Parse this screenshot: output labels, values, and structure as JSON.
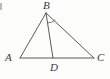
{
  "figure": {
    "kind": "geometry-diagram",
    "background_color": "#fdfdfc",
    "stroke_color": "#5a5a5a",
    "label_color": "#3b3b3b",
    "labels": {
      "a": "A",
      "b": "B",
      "c": "C",
      "d": "D"
    },
    "vertices": [
      {
        "name": "A",
        "x": 20,
        "y": 58
      },
      {
        "name": "B",
        "x": 46,
        "y": 13
      },
      {
        "name": "C",
        "x": 94,
        "y": 58
      },
      {
        "name": "D",
        "x": 53,
        "y": 58
      }
    ],
    "segments": [
      {
        "name": "AB",
        "from": "A",
        "to": "B"
      },
      {
        "name": "BC",
        "from": "B",
        "to": "C"
      },
      {
        "name": "AC",
        "from": "A",
        "to": "C"
      },
      {
        "name": "BD",
        "from": "B",
        "to": "D"
      }
    ],
    "angle_marks": [
      {
        "name": "angle-DBC",
        "at": "B",
        "between": "BD and BC"
      }
    ]
  }
}
